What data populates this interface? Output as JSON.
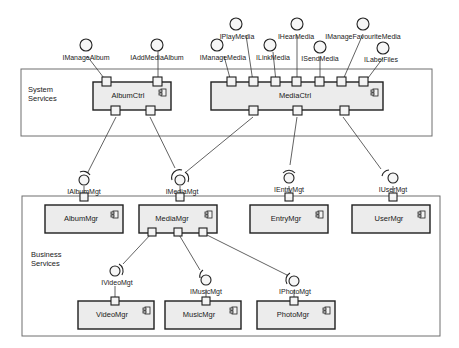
{
  "frames": {
    "system": {
      "label_line1": "System",
      "label_line2": "Services"
    },
    "business": {
      "label_line1": "Business",
      "label_line2": "Services"
    }
  },
  "components": {
    "album_ctrl": "AlbumCtrl",
    "media_ctrl": "MediaCtrl",
    "album_mgr": "AlbumMgr",
    "media_mgr": "MediaMgr",
    "entry_mgr": "EntryMgr",
    "user_mgr": "UserMgr",
    "video_mgr": "VideoMgr",
    "music_mgr": "MusicMgr",
    "photo_mgr": "PhotoMgr"
  },
  "provided_interfaces": {
    "imanage_album": "IManageAlbum",
    "iadd_media_album": "IAddMediaAlbum",
    "imanage_media": "IManageMedia",
    "iplay_media": "IPlayMedia",
    "ilink_media": "ILinkMedia",
    "ihear_media": "IHearMedia",
    "isend_media": "ISendMedia",
    "imanage_favourite_media": "IManageFavouriteMedia",
    "ilabel_files": "ILabelFiles"
  },
  "required_interfaces": {
    "ialbum_mgt": "IAlbumMgt",
    "imedia_mgt": "IMediaMgt",
    "ientry_mgt": "IEntryMgt",
    "iuser_mgt": "IUserMgt",
    "ivideo_mgt": "IVideoMgt",
    "imusic_mgt": "IMusicMgt",
    "iphoto_mgt": "IPhotoMgt"
  }
}
